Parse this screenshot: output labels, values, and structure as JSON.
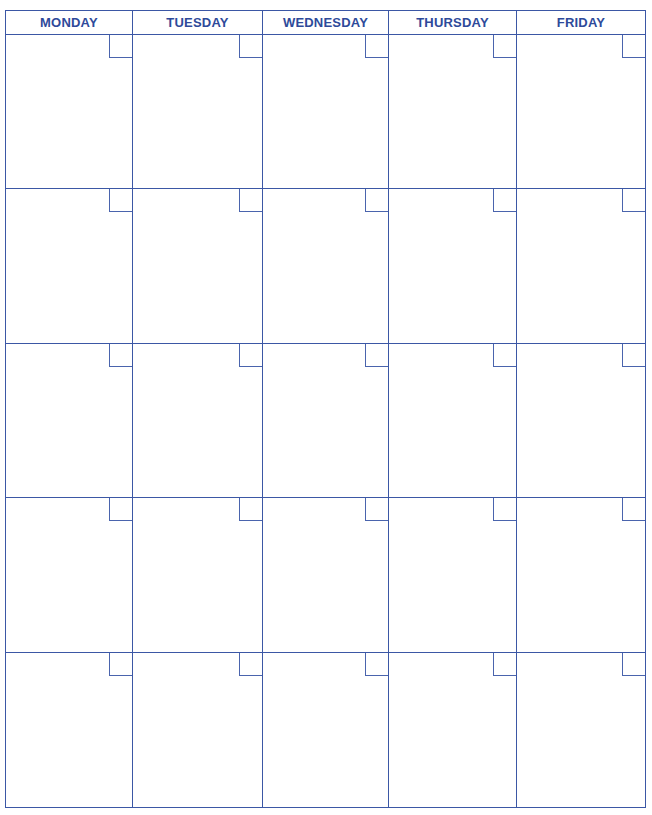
{
  "calendar": {
    "days": [
      "MONDAY",
      "TUESDAY",
      "WEDNESDAY",
      "THURSDAY",
      "FRIDAY"
    ],
    "weeks": 5,
    "line_color": "#3b57a5",
    "header_text_color": "#2e4a9a"
  }
}
